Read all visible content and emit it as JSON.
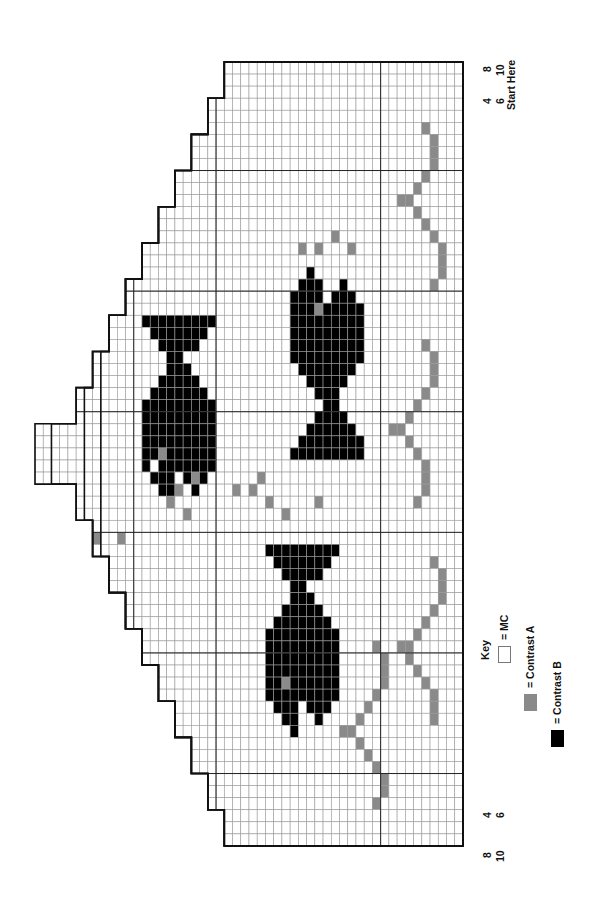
{
  "chart": {
    "orientation": "rotated 90deg counter-clockwise",
    "grid": {
      "cols": 52,
      "rows": 65,
      "origin_x": 35,
      "origin_y": 62,
      "cell_w": 8.23,
      "cell_h": 12.06,
      "major_every": 10
    },
    "colors": {
      "mc": "#ffffff",
      "contrast_a": "#8a8a8a",
      "contrast_b": "#000000",
      "grid_line": "#9a9a9a",
      "major_line": "#222222",
      "outline": "#111111"
    },
    "size_labels_top": [
      {
        "label": "4",
        "x": 481,
        "y": 104
      },
      {
        "label": "6",
        "x": 494,
        "y": 104
      },
      {
        "label": "8",
        "x": 481,
        "y": 72
      },
      {
        "label": "10",
        "x": 494,
        "y": 76
      }
    ],
    "size_labels_bottom": [
      {
        "label": "4",
        "x": 481,
        "y": 818
      },
      {
        "label": "6",
        "x": 494,
        "y": 818
      },
      {
        "label": "8",
        "x": 481,
        "y": 858
      },
      {
        "label": "10",
        "x": 494,
        "y": 862
      }
    ],
    "start_label": "Start Here",
    "key": {
      "title": "Key",
      "items": [
        {
          "label": "= MC",
          "color": "#ffffff"
        },
        {
          "label": "= Contrast A",
          "color": "#8a8a8a"
        },
        {
          "label": "= Contrast B",
          "color": "#000000"
        }
      ]
    },
    "contrast_b_cells": [
      [
        13,
        21
      ],
      [
        14,
        21
      ],
      [
        15,
        21
      ],
      [
        16,
        21
      ],
      [
        17,
        21
      ],
      [
        18,
        21
      ],
      [
        19,
        21
      ],
      [
        20,
        21
      ],
      [
        21,
        21
      ],
      [
        14,
        22
      ],
      [
        15,
        22
      ],
      [
        16,
        22
      ],
      [
        17,
        22
      ],
      [
        18,
        22
      ],
      [
        19,
        22
      ],
      [
        20,
        22
      ],
      [
        15,
        23
      ],
      [
        16,
        23
      ],
      [
        17,
        23
      ],
      [
        18,
        23
      ],
      [
        19,
        23
      ],
      [
        16,
        24
      ],
      [
        17,
        24
      ],
      [
        16,
        25
      ],
      [
        17,
        25
      ],
      [
        18,
        25
      ],
      [
        15,
        26
      ],
      [
        16,
        26
      ],
      [
        17,
        26
      ],
      [
        18,
        26
      ],
      [
        19,
        26
      ],
      [
        14,
        27
      ],
      [
        15,
        27
      ],
      [
        16,
        27
      ],
      [
        17,
        27
      ],
      [
        18,
        27
      ],
      [
        19,
        27
      ],
      [
        20,
        27
      ],
      [
        13,
        28
      ],
      [
        14,
        28
      ],
      [
        15,
        28
      ],
      [
        16,
        28
      ],
      [
        17,
        28
      ],
      [
        18,
        28
      ],
      [
        19,
        28
      ],
      [
        20,
        28
      ],
      [
        21,
        28
      ],
      [
        13,
        29
      ],
      [
        14,
        29
      ],
      [
        15,
        29
      ],
      [
        16,
        29
      ],
      [
        17,
        29
      ],
      [
        18,
        29
      ],
      [
        19,
        29
      ],
      [
        20,
        29
      ],
      [
        21,
        29
      ],
      [
        13,
        30
      ],
      [
        14,
        30
      ],
      [
        15,
        30
      ],
      [
        16,
        30
      ],
      [
        17,
        30
      ],
      [
        18,
        30
      ],
      [
        19,
        30
      ],
      [
        20,
        30
      ],
      [
        21,
        30
      ],
      [
        13,
        31
      ],
      [
        14,
        31
      ],
      [
        15,
        31
      ],
      [
        16,
        31
      ],
      [
        17,
        31
      ],
      [
        18,
        31
      ],
      [
        19,
        31
      ],
      [
        20,
        31
      ],
      [
        21,
        31
      ],
      [
        13,
        32
      ],
      [
        14,
        32
      ],
      [
        15,
        32
      ],
      [
        16,
        32
      ],
      [
        17,
        32
      ],
      [
        18,
        32
      ],
      [
        19,
        32
      ],
      [
        20,
        32
      ],
      [
        21,
        32
      ],
      [
        13,
        33
      ],
      [
        15,
        33
      ],
      [
        16,
        33
      ],
      [
        17,
        33
      ],
      [
        18,
        33
      ],
      [
        19,
        33
      ],
      [
        20,
        33
      ],
      [
        21,
        33
      ],
      [
        14,
        34
      ],
      [
        15,
        34
      ],
      [
        16,
        34
      ],
      [
        18,
        34
      ],
      [
        19,
        34
      ],
      [
        20,
        34
      ],
      [
        15,
        35
      ],
      [
        16,
        35
      ],
      [
        19,
        35
      ],
      [
        16,
        36
      ],
      [
        33,
        17
      ],
      [
        32,
        18
      ],
      [
        33,
        18
      ],
      [
        34,
        18
      ],
      [
        37,
        18
      ],
      [
        31,
        19
      ],
      [
        32,
        19
      ],
      [
        33,
        19
      ],
      [
        34,
        19
      ],
      [
        36,
        19
      ],
      [
        37,
        19
      ],
      [
        38,
        19
      ],
      [
        31,
        20
      ],
      [
        32,
        20
      ],
      [
        33,
        20
      ],
      [
        34,
        20
      ],
      [
        35,
        20
      ],
      [
        36,
        20
      ],
      [
        37,
        20
      ],
      [
        38,
        20
      ],
      [
        39,
        20
      ],
      [
        31,
        21
      ],
      [
        32,
        21
      ],
      [
        33,
        21
      ],
      [
        34,
        21
      ],
      [
        35,
        21
      ],
      [
        36,
        21
      ],
      [
        37,
        21
      ],
      [
        38,
        21
      ],
      [
        39,
        21
      ],
      [
        31,
        22
      ],
      [
        32,
        22
      ],
      [
        33,
        22
      ],
      [
        34,
        22
      ],
      [
        35,
        22
      ],
      [
        36,
        22
      ],
      [
        37,
        22
      ],
      [
        38,
        22
      ],
      [
        39,
        22
      ],
      [
        31,
        23
      ],
      [
        32,
        23
      ],
      [
        33,
        23
      ],
      [
        34,
        23
      ],
      [
        35,
        23
      ],
      [
        36,
        23
      ],
      [
        37,
        23
      ],
      [
        38,
        23
      ],
      [
        39,
        23
      ],
      [
        31,
        24
      ],
      [
        32,
        24
      ],
      [
        33,
        24
      ],
      [
        34,
        24
      ],
      [
        35,
        24
      ],
      [
        36,
        24
      ],
      [
        37,
        24
      ],
      [
        38,
        24
      ],
      [
        39,
        24
      ],
      [
        32,
        25
      ],
      [
        33,
        25
      ],
      [
        34,
        25
      ],
      [
        35,
        25
      ],
      [
        36,
        25
      ],
      [
        37,
        25
      ],
      [
        38,
        25
      ],
      [
        33,
        26
      ],
      [
        34,
        26
      ],
      [
        35,
        26
      ],
      [
        36,
        26
      ],
      [
        37,
        26
      ],
      [
        34,
        27
      ],
      [
        35,
        27
      ],
      [
        36,
        27
      ],
      [
        35,
        28
      ],
      [
        36,
        28
      ],
      [
        34,
        29
      ],
      [
        35,
        29
      ],
      [
        36,
        29
      ],
      [
        37,
        29
      ],
      [
        33,
        30
      ],
      [
        34,
        30
      ],
      [
        35,
        30
      ],
      [
        36,
        30
      ],
      [
        37,
        30
      ],
      [
        38,
        30
      ],
      [
        32,
        31
      ],
      [
        33,
        31
      ],
      [
        34,
        31
      ],
      [
        35,
        31
      ],
      [
        36,
        31
      ],
      [
        37,
        31
      ],
      [
        38,
        31
      ],
      [
        39,
        31
      ],
      [
        31,
        32
      ],
      [
        32,
        32
      ],
      [
        33,
        32
      ],
      [
        34,
        32
      ],
      [
        35,
        32
      ],
      [
        36,
        32
      ],
      [
        37,
        32
      ],
      [
        38,
        32
      ],
      [
        39,
        32
      ],
      [
        28,
        40
      ],
      [
        29,
        40
      ],
      [
        30,
        40
      ],
      [
        31,
        40
      ],
      [
        32,
        40
      ],
      [
        33,
        40
      ],
      [
        34,
        40
      ],
      [
        35,
        40
      ],
      [
        36,
        40
      ],
      [
        29,
        41
      ],
      [
        30,
        41
      ],
      [
        31,
        41
      ],
      [
        32,
        41
      ],
      [
        33,
        41
      ],
      [
        34,
        41
      ],
      [
        35,
        41
      ],
      [
        30,
        42
      ],
      [
        31,
        42
      ],
      [
        32,
        42
      ],
      [
        33,
        42
      ],
      [
        34,
        42
      ],
      [
        31,
        43
      ],
      [
        32,
        43
      ],
      [
        31,
        44
      ],
      [
        32,
        44
      ],
      [
        33,
        44
      ],
      [
        30,
        45
      ],
      [
        31,
        45
      ],
      [
        32,
        45
      ],
      [
        33,
        45
      ],
      [
        34,
        45
      ],
      [
        29,
        46
      ],
      [
        30,
        46
      ],
      [
        31,
        46
      ],
      [
        32,
        46
      ],
      [
        33,
        46
      ],
      [
        34,
        46
      ],
      [
        35,
        46
      ],
      [
        28,
        47
      ],
      [
        29,
        47
      ],
      [
        30,
        47
      ],
      [
        31,
        47
      ],
      [
        32,
        47
      ],
      [
        33,
        47
      ],
      [
        34,
        47
      ],
      [
        35,
        47
      ],
      [
        36,
        47
      ],
      [
        28,
        48
      ],
      [
        29,
        48
      ],
      [
        30,
        48
      ],
      [
        31,
        48
      ],
      [
        32,
        48
      ],
      [
        33,
        48
      ],
      [
        34,
        48
      ],
      [
        35,
        48
      ],
      [
        36,
        48
      ],
      [
        28,
        49
      ],
      [
        29,
        49
      ],
      [
        30,
        49
      ],
      [
        31,
        49
      ],
      [
        32,
        49
      ],
      [
        33,
        49
      ],
      [
        34,
        49
      ],
      [
        35,
        49
      ],
      [
        36,
        49
      ],
      [
        28,
        50
      ],
      [
        29,
        50
      ],
      [
        30,
        50
      ],
      [
        31,
        50
      ],
      [
        32,
        50
      ],
      [
        33,
        50
      ],
      [
        34,
        50
      ],
      [
        35,
        50
      ],
      [
        36,
        50
      ],
      [
        28,
        51
      ],
      [
        29,
        51
      ],
      [
        30,
        51
      ],
      [
        31,
        51
      ],
      [
        32,
        51
      ],
      [
        33,
        51
      ],
      [
        34,
        51
      ],
      [
        35,
        51
      ],
      [
        36,
        51
      ],
      [
        28,
        52
      ],
      [
        29,
        52
      ],
      [
        30,
        52
      ],
      [
        31,
        52
      ],
      [
        32,
        52
      ],
      [
        33,
        52
      ],
      [
        34,
        52
      ],
      [
        35,
        52
      ],
      [
        36,
        52
      ],
      [
        29,
        53
      ],
      [
        30,
        53
      ],
      [
        31,
        53
      ],
      [
        33,
        53
      ],
      [
        34,
        53
      ],
      [
        35,
        53
      ],
      [
        30,
        54
      ],
      [
        31,
        54
      ],
      [
        34,
        54
      ],
      [
        31,
        55
      ]
    ],
    "contrast_a_cells": [
      [
        15,
        32
      ],
      [
        34,
        20
      ],
      [
        30,
        51
      ],
      [
        7,
        39
      ],
      [
        10,
        39
      ],
      [
        16,
        36
      ],
      [
        17,
        35
      ],
      [
        19,
        34
      ],
      [
        27,
        34
      ],
      [
        18,
        37
      ],
      [
        30,
        37
      ],
      [
        24,
        35
      ],
      [
        26,
        35
      ],
      [
        28,
        36
      ],
      [
        34,
        36
      ],
      [
        32,
        15
      ],
      [
        34,
        15
      ],
      [
        36,
        14
      ],
      [
        38,
        15
      ],
      [
        47,
        5
      ],
      [
        48,
        6
      ],
      [
        48,
        7
      ],
      [
        48,
        8
      ],
      [
        47,
        9
      ],
      [
        46,
        10
      ],
      [
        45,
        11
      ],
      [
        44,
        11
      ],
      [
        46,
        12
      ],
      [
        47,
        13
      ],
      [
        48,
        14
      ],
      [
        49,
        15
      ],
      [
        49,
        16
      ],
      [
        49,
        17
      ],
      [
        48,
        18
      ],
      [
        47,
        23
      ],
      [
        48,
        24
      ],
      [
        48,
        25
      ],
      [
        48,
        26
      ],
      [
        47,
        27
      ],
      [
        46,
        28
      ],
      [
        45,
        29
      ],
      [
        44,
        30
      ],
      [
        43,
        30
      ],
      [
        45,
        31
      ],
      [
        46,
        32
      ],
      [
        47,
        33
      ],
      [
        47,
        34
      ],
      [
        47,
        35
      ],
      [
        46,
        36
      ],
      [
        48,
        41
      ],
      [
        49,
        42
      ],
      [
        49,
        43
      ],
      [
        49,
        44
      ],
      [
        48,
        45
      ],
      [
        47,
        46
      ],
      [
        46,
        47
      ],
      [
        45,
        48
      ],
      [
        44,
        48
      ],
      [
        45,
        49
      ],
      [
        46,
        50
      ],
      [
        47,
        51
      ],
      [
        48,
        52
      ],
      [
        48,
        53
      ],
      [
        48,
        54
      ],
      [
        41,
        48
      ],
      [
        42,
        49
      ],
      [
        42,
        50
      ],
      [
        42,
        51
      ],
      [
        41,
        52
      ],
      [
        40,
        53
      ],
      [
        39,
        54
      ],
      [
        38,
        55
      ],
      [
        37,
        55
      ],
      [
        39,
        56
      ],
      [
        40,
        57
      ],
      [
        41,
        58
      ],
      [
        42,
        59
      ],
      [
        42,
        60
      ],
      [
        41,
        61
      ]
    ],
    "outlines": [
      {
        "size": "10",
        "start_col": 0
      },
      {
        "size": "8",
        "start_col": 2
      },
      {
        "size": "6",
        "start_col": 6
      },
      {
        "size": "4",
        "start_col": 8
      }
    ]
  }
}
